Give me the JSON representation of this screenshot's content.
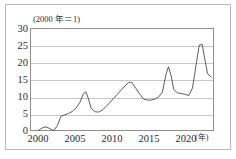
{
  "figure": {
    "base_note": "(2000 年＝1)",
    "x_unit_note": "(年)"
  },
  "chart_data": {
    "type": "line",
    "title": "(2000 年＝1)",
    "xlabel": "(年)",
    "ylabel": "",
    "xlim": [
      1999,
      2023.5
    ],
    "ylim": [
      0,
      30
    ],
    "yticks": [
      0,
      5,
      10,
      15,
      20,
      25,
      30
    ],
    "xticks": [
      2000,
      2005,
      2010,
      2015,
      2020
    ],
    "grid": "horizontal",
    "legend": "none",
    "series": [
      {
        "name": "index",
        "x": [
          2000,
          2000.5,
          2001,
          2001.5,
          2002,
          2002.5,
          2003,
          2003.5,
          2004,
          2004.5,
          2005,
          2005.5,
          2006,
          2006.3,
          2006.6,
          2007,
          2007.5,
          2008,
          2008.5,
          2009,
          2009.5,
          2010,
          2010.5,
          2011,
          2011.5,
          2012,
          2012.4,
          2013,
          2013.5,
          2014,
          2014.5,
          2015,
          2015.5,
          2016,
          2016.5,
          2017,
          2017.3,
          2017.7,
          2018,
          2018.5,
          2019,
          2019.5,
          2020,
          2020.5,
          2021,
          2021.4,
          2021.8,
          2022,
          2022.5,
          2023
        ],
        "values": [
          0.5,
          1.2,
          1.5,
          1.0,
          0.4,
          1.8,
          4.6,
          5.0,
          5.4,
          6.0,
          7.0,
          8.6,
          11.2,
          11.7,
          10.0,
          7.0,
          5.9,
          5.8,
          6.4,
          7.4,
          8.6,
          9.8,
          11.0,
          12.2,
          13.4,
          14.4,
          14.5,
          12.6,
          11.0,
          9.6,
          9.3,
          9.3,
          9.6,
          10.2,
          11.6,
          17.0,
          19.0,
          16.0,
          12.4,
          11.4,
          11.2,
          11.0,
          10.6,
          12.8,
          19.8,
          25.3,
          25.5,
          23.0,
          17.0,
          16.0
        ]
      }
    ]
  },
  "axis": {
    "y_tick_labels": [
      "30",
      "25",
      "20",
      "15",
      "10",
      "5",
      "0"
    ],
    "x_tick_labels": [
      "2000",
      "2005",
      "2010",
      "2015",
      "2020"
    ]
  },
  "style": {
    "line_color": "#4a4a4a",
    "grid_color": "#c7c7c7",
    "axis_color": "#8f8f8f",
    "frame_color": "#b9b9b9",
    "background": "#ffffff"
  }
}
